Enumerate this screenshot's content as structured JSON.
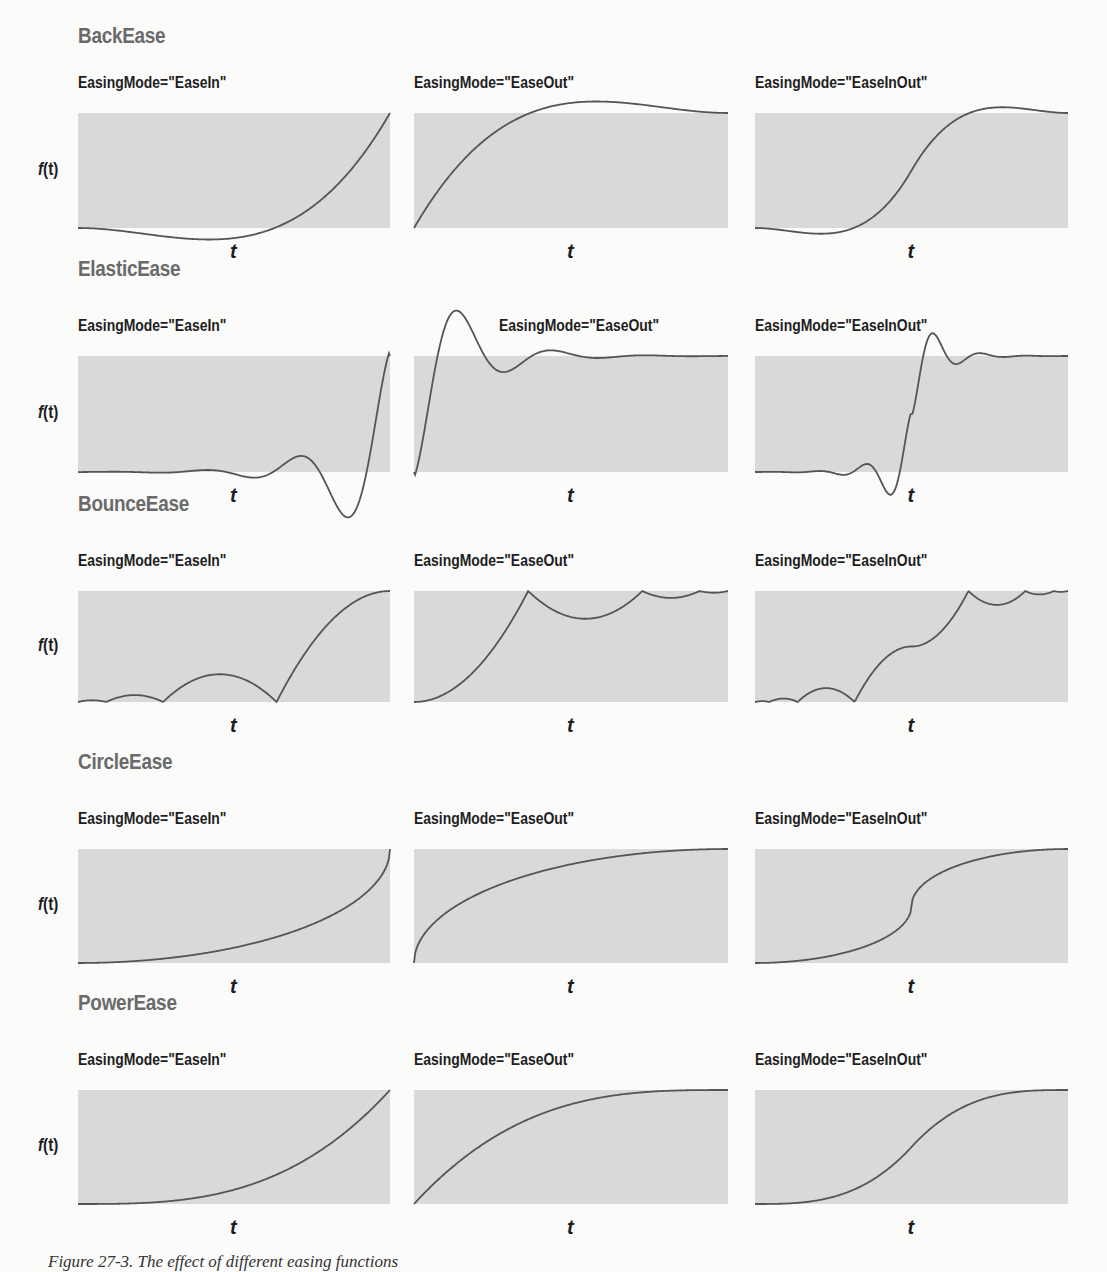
{
  "figure": {
    "caption": "Figure 27-3. The effect of different easing functions",
    "y_axis_label_prefix": "f",
    "y_axis_label_suffix": "(t)",
    "x_axis_label": "t"
  },
  "rows": [
    {
      "title": "BackEase",
      "modes": [
        "EasingMode=\"EaseIn\"",
        "EasingMode=\"EaseOut\"",
        "EasingMode=\"EaseInOut\""
      ]
    },
    {
      "title": "ElasticEase",
      "modes": [
        "EasingMode=\"EaseIn\"",
        "EasingMode=\"EaseOut\"",
        "EasingMode=\"EaseInOut\""
      ]
    },
    {
      "title": "BounceEase",
      "modes": [
        "EasingMode=\"EaseIn\"",
        "EasingMode=\"EaseOut\"",
        "EasingMode=\"EaseInOut\""
      ]
    },
    {
      "title": "CircleEase",
      "modes": [
        "EasingMode=\"EaseIn\"",
        "EasingMode=\"EaseOut\"",
        "EasingMode=\"EaseInOut\""
      ]
    },
    {
      "title": "PowerEase",
      "modes": [
        "EasingMode=\"EaseIn\"",
        "EasingMode=\"EaseOut\"",
        "EasingMode=\"EaseInOut\""
      ]
    }
  ],
  "colors": {
    "plot_background": "#d9d9d9",
    "curve": "#555555",
    "section_title": "#6a6a6a",
    "label": "#1e1e1e"
  },
  "chart_data": [
    {
      "type": "line",
      "title": "BackEase EaseIn",
      "xlabel": "t",
      "ylabel": "f(t)",
      "x": [
        0,
        0.1,
        0.2,
        0.3,
        0.4,
        0.5,
        0.6,
        0.7,
        0.8,
        0.9,
        1.0
      ],
      "y": [
        0,
        -0.04,
        -0.11,
        -0.18,
        -0.23,
        -0.25,
        -0.21,
        -0.1,
        0.1,
        0.46,
        1.0
      ],
      "ylim": [
        0,
        1
      ]
    },
    {
      "type": "line",
      "title": "BackEase EaseOut",
      "xlabel": "t",
      "ylabel": "f(t)",
      "x": [
        0,
        0.1,
        0.2,
        0.3,
        0.4,
        0.5,
        0.6,
        0.7,
        0.8,
        0.9,
        1.0
      ],
      "y": [
        0,
        0.54,
        0.9,
        1.1,
        1.21,
        1.25,
        1.23,
        1.18,
        1.11,
        1.04,
        1.0
      ],
      "ylim": [
        0,
        1
      ]
    },
    {
      "type": "line",
      "title": "BackEase EaseInOut",
      "xlabel": "t",
      "ylabel": "f(t)",
      "x": [
        0,
        0.1,
        0.2,
        0.3,
        0.4,
        0.5,
        0.6,
        0.7,
        0.8,
        0.9,
        1.0
      ],
      "y": [
        0,
        -0.12,
        -0.25,
        -0.2,
        0.15,
        0.5,
        0.85,
        1.2,
        1.25,
        1.12,
        1.0
      ],
      "ylim": [
        0,
        1
      ]
    },
    {
      "type": "line",
      "title": "ElasticEase EaseIn",
      "xlabel": "t",
      "ylabel": "f(t)",
      "x": [
        0,
        0.1,
        0.2,
        0.3,
        0.4,
        0.5,
        0.6,
        0.7,
        0.8,
        0.85,
        0.9,
        1.0
      ],
      "y": [
        0,
        0.02,
        -0.01,
        0.01,
        -0.02,
        -0.06,
        0.0,
        0.14,
        -0.1,
        -0.32,
        0.0,
        1.0
      ],
      "ylim": [
        0,
        1
      ]
    },
    {
      "type": "line",
      "title": "ElasticEase EaseOut",
      "xlabel": "t",
      "ylabel": "f(t)",
      "x": [
        0,
        0.1,
        0.15,
        0.2,
        0.3,
        0.4,
        0.5,
        0.6,
        0.7,
        0.8,
        0.9,
        1.0
      ],
      "y": [
        0,
        1.0,
        1.32,
        1.1,
        0.86,
        1.06,
        1.0,
        0.98,
        1.01,
        0.99,
        1.0,
        1.0
      ],
      "ylim": [
        0,
        1
      ]
    },
    {
      "type": "line",
      "title": "ElasticEase EaseInOut",
      "xlabel": "t",
      "ylabel": "f(t)",
      "x": [
        0,
        0.1,
        0.2,
        0.3,
        0.35,
        0.4,
        0.5,
        0.6,
        0.65,
        0.7,
        0.8,
        0.9,
        1.0
      ],
      "y": [
        0,
        -0.06,
        -0.02,
        -0.18,
        -0.16,
        0.1,
        0.5,
        0.9,
        1.16,
        1.06,
        0.94,
        1.02,
        1.0
      ],
      "ylim": [
        0,
        1
      ]
    },
    {
      "type": "line",
      "title": "BounceEase EaseIn",
      "xlabel": "t",
      "ylabel": "f(t)",
      "x": [
        0,
        0.05,
        0.09,
        0.2,
        0.3,
        0.45,
        0.6,
        0.73,
        0.85,
        1.0
      ],
      "y": [
        0,
        0.06,
        0,
        0.12,
        0,
        0.31,
        0.12,
        0,
        0.75,
        1.0
      ],
      "ylim": [
        0,
        1
      ]
    },
    {
      "type": "line",
      "title": "BounceEase EaseOut",
      "xlabel": "t",
      "ylabel": "f(t)",
      "x": [
        0,
        0.15,
        0.27,
        0.4,
        0.55,
        0.7,
        0.8,
        0.91,
        0.95,
        1.0
      ],
      "y": [
        0,
        0.25,
        1.0,
        0.69,
        0.88,
        1.0,
        0.88,
        1.0,
        0.94,
        1.0
      ],
      "ylim": [
        0,
        1
      ]
    },
    {
      "type": "line",
      "title": "BounceEase EaseInOut",
      "xlabel": "t",
      "ylabel": "f(t)",
      "x": [
        0,
        0.05,
        0.13,
        0.2,
        0.27,
        0.4,
        0.5,
        0.55,
        0.6,
        0.67,
        0.75,
        0.85,
        0.9,
        0.95,
        1.0
      ],
      "y": [
        0,
        0.02,
        0.0,
        0.1,
        0,
        0.38,
        0.5,
        0.53,
        0.62,
        1.0,
        0.9,
        1.0,
        0.96,
        1.0,
        1.0
      ],
      "ylim": [
        0,
        1
      ]
    },
    {
      "type": "line",
      "title": "CircleEase EaseIn",
      "xlabel": "t",
      "ylabel": "f(t)",
      "x": [
        0,
        0.2,
        0.4,
        0.6,
        0.8,
        0.9,
        0.95,
        1.0
      ],
      "y": [
        0,
        0.02,
        0.08,
        0.2,
        0.4,
        0.56,
        0.69,
        1.0
      ],
      "ylim": [
        0,
        1
      ]
    },
    {
      "type": "line",
      "title": "CircleEase EaseOut",
      "xlabel": "t",
      "ylabel": "f(t)",
      "x": [
        0,
        0.05,
        0.1,
        0.2,
        0.4,
        0.6,
        0.8,
        1.0
      ],
      "y": [
        0,
        0.31,
        0.44,
        0.6,
        0.8,
        0.92,
        0.98,
        1.0
      ],
      "ylim": [
        0,
        1
      ]
    },
    {
      "type": "line",
      "title": "CircleEase EaseInOut",
      "xlabel": "t",
      "ylabel": "f(t)",
      "x": [
        0,
        0.2,
        0.4,
        0.45,
        0.5,
        0.55,
        0.6,
        0.8,
        1.0
      ],
      "y": [
        0,
        0.04,
        0.2,
        0.28,
        0.5,
        0.72,
        0.8,
        0.96,
        1.0
      ],
      "ylim": [
        0,
        1
      ]
    },
    {
      "type": "line",
      "title": "PowerEase EaseIn",
      "xlabel": "t",
      "ylabel": "f(t)",
      "x": [
        0,
        0.2,
        0.4,
        0.6,
        0.8,
        1.0
      ],
      "y": [
        0,
        0.01,
        0.06,
        0.22,
        0.51,
        1.0
      ],
      "ylim": [
        0,
        1
      ]
    },
    {
      "type": "line",
      "title": "PowerEase EaseOut",
      "xlabel": "t",
      "ylabel": "f(t)",
      "x": [
        0,
        0.2,
        0.4,
        0.6,
        0.8,
        1.0
      ],
      "y": [
        0,
        0.49,
        0.78,
        0.94,
        0.99,
        1.0
      ],
      "ylim": [
        0,
        1
      ]
    },
    {
      "type": "line",
      "title": "PowerEase EaseInOut",
      "xlabel": "t",
      "ylabel": "f(t)",
      "x": [
        0,
        0.1,
        0.2,
        0.3,
        0.4,
        0.5,
        0.6,
        0.7,
        0.8,
        0.9,
        1.0
      ],
      "y": [
        0,
        0.01,
        0.03,
        0.11,
        0.26,
        0.5,
        0.74,
        0.89,
        0.97,
        0.99,
        1.0
      ],
      "ylim": [
        0,
        1
      ]
    }
  ]
}
